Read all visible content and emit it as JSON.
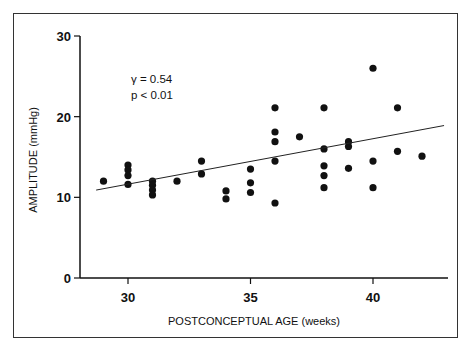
{
  "chart_data": {
    "type": "scatter",
    "title": "",
    "xlabel": "POSTCONCEPTUAL AGE (weeks)",
    "ylabel": "AMPLITUDE (mmHg)",
    "xlim": [
      27,
      43
    ],
    "ylim": [
      0,
      30
    ],
    "x_ticks": [
      30,
      35,
      40
    ],
    "y_ticks": [
      0,
      10,
      20,
      30
    ],
    "grid": false,
    "annotations": [
      "γ = 0.54",
      "p < 0.01"
    ],
    "points": [
      {
        "x": 29,
        "y": 12.0
      },
      {
        "x": 30,
        "y": 14.0
      },
      {
        "x": 30,
        "y": 13.4
      },
      {
        "x": 30,
        "y": 12.7
      },
      {
        "x": 30,
        "y": 11.6
      },
      {
        "x": 31,
        "y": 12.0
      },
      {
        "x": 31,
        "y": 11.5
      },
      {
        "x": 31,
        "y": 10.9
      },
      {
        "x": 31,
        "y": 10.3
      },
      {
        "x": 32,
        "y": 12.0
      },
      {
        "x": 33,
        "y": 14.5
      },
      {
        "x": 33,
        "y": 12.9
      },
      {
        "x": 34,
        "y": 10.8
      },
      {
        "x": 34,
        "y": 9.8
      },
      {
        "x": 35,
        "y": 13.5
      },
      {
        "x": 35,
        "y": 11.8
      },
      {
        "x": 35,
        "y": 10.6
      },
      {
        "x": 36,
        "y": 21.1
      },
      {
        "x": 36,
        "y": 18.1
      },
      {
        "x": 36,
        "y": 16.9
      },
      {
        "x": 36,
        "y": 14.5
      },
      {
        "x": 36,
        "y": 9.3
      },
      {
        "x": 37,
        "y": 17.5
      },
      {
        "x": 38,
        "y": 21.1
      },
      {
        "x": 38,
        "y": 16.0
      },
      {
        "x": 38,
        "y": 13.9
      },
      {
        "x": 38,
        "y": 12.7
      },
      {
        "x": 38,
        "y": 11.2
      },
      {
        "x": 39,
        "y": 16.9
      },
      {
        "x": 39,
        "y": 16.3
      },
      {
        "x": 39,
        "y": 13.6
      },
      {
        "x": 40,
        "y": 26.0
      },
      {
        "x": 40,
        "y": 14.5
      },
      {
        "x": 40,
        "y": 11.2
      },
      {
        "x": 41,
        "y": 21.1
      },
      {
        "x": 41,
        "y": 15.7
      },
      {
        "x": 42,
        "y": 15.1
      }
    ],
    "regression_line": {
      "x": [
        28.7,
        42.9
      ],
      "y": [
        10.9,
        18.9
      ]
    }
  },
  "annotation": {
    "line1": "γ = 0.54",
    "line2": "p < 0.01"
  },
  "axes": {
    "xlabel": "POSTCONCEPTUAL AGE (weeks)",
    "ylabel": "AMPLITUDE (mmHg)",
    "x_tick_labels": [
      "30",
      "35",
      "40"
    ],
    "y_tick_labels": [
      "0",
      "10",
      "20",
      "30"
    ]
  }
}
